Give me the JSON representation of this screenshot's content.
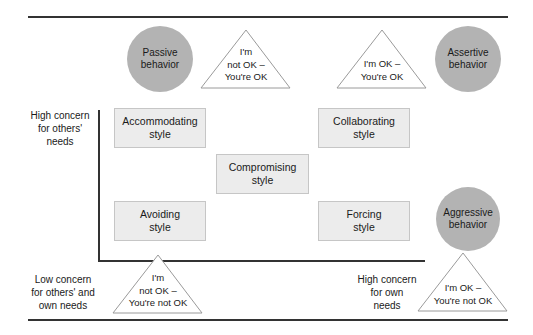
{
  "diagram": {
    "type": "conflict-management-styles-grid",
    "styles": [
      {
        "id": "accommodating",
        "label": "Accommodating\nstyle"
      },
      {
        "id": "collaborating",
        "label": "Collaborating\nstyle"
      },
      {
        "id": "compromising",
        "label": "Compromising\nstyle"
      },
      {
        "id": "avoiding",
        "label": "Avoiding\nstyle"
      },
      {
        "id": "forcing",
        "label": "Forcing\nstyle"
      }
    ],
    "behaviors": [
      {
        "id": "passive",
        "label": "Passive\nbehavior"
      },
      {
        "id": "assertive",
        "label": "Assertive\nbehavior"
      },
      {
        "id": "aggressive",
        "label": "Aggressive\nbehavior"
      }
    ],
    "positions": [
      {
        "id": "not-ok-you-ok",
        "label": "I'm\nnot OK –\nYou're OK"
      },
      {
        "id": "ok-you-ok",
        "label": "I'm OK –\nYou're OK"
      },
      {
        "id": "not-ok-you-not-ok",
        "label": "I'm\nnot OK –\nYou're not OK"
      },
      {
        "id": "ok-you-not-ok",
        "label": "I'm OK –\nYou're not OK"
      }
    ],
    "axis_labels": {
      "high_others": "High concern\nfor others'\nneeds",
      "low_both": "Low concern\nfor others' and\nown needs",
      "high_own": "High concern\nfor own\nneeds"
    },
    "colors": {
      "circle_fill": "#b3b3b3",
      "box_fill": "#ececec",
      "box_border": "#c6c6c6",
      "line": "#333333"
    }
  }
}
